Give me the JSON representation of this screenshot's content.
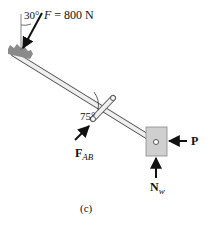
{
  "figure": {
    "caption": "(c)",
    "applied_force": {
      "angle_label": "30°",
      "symbol": "F",
      "equals": " = 800 N"
    },
    "link_angle_label": "75°",
    "link_force": {
      "symbol": "F",
      "subscript": "AB"
    },
    "horizontal_force": {
      "symbol": "P"
    },
    "normal_force": {
      "symbol": "N",
      "subscript": "w"
    },
    "colors": {
      "rod": "#d9d9d9",
      "rod_outline": "#555555",
      "block": "#cfcfcf",
      "grip": "#8a8a8a",
      "arrow": "#111111"
    }
  }
}
